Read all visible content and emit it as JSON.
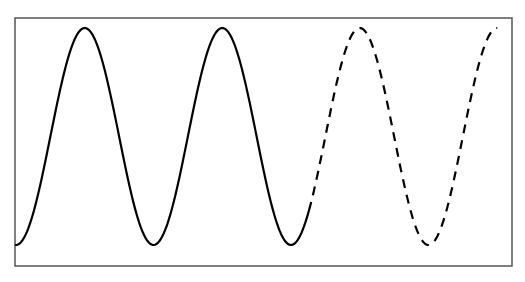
{
  "chart_data": {
    "type": "line",
    "title": "",
    "xlabel": "",
    "ylabel": "",
    "grid": false,
    "legend": null,
    "x_unit": "periods",
    "xlim": [
      0,
      3.6
    ],
    "ylim": [
      -1.1,
      1.1
    ],
    "series": [
      {
        "name": "observed",
        "style": "solid",
        "color": "#000000",
        "function": "-cos(2*pi*x)",
        "x_range": [
          0,
          2.13
        ],
        "peaks_x": [
          0.5,
          1.5
        ],
        "troughs_x": [
          0,
          1,
          2
        ]
      },
      {
        "name": "projected",
        "style": "dashed",
        "color": "#000000",
        "function": "-cos(2*pi*x)",
        "x_range": [
          2.13,
          3.5
        ],
        "peaks_x": [
          2.5,
          3.5
        ],
        "troughs_x": [
          3
        ]
      }
    ]
  },
  "frame": {
    "left": 15,
    "top": 18,
    "right": 512,
    "bottom": 266,
    "color": "#555555"
  },
  "plot_mapping": {
    "x0_px": 16,
    "period_px": 137.5,
    "y_peak_px": 28,
    "y_trough_px": 245
  }
}
